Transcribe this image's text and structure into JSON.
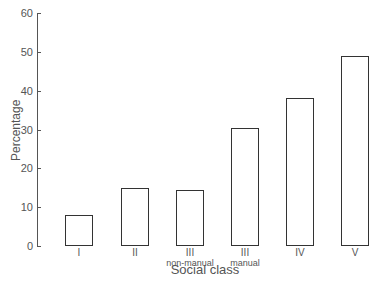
{
  "chart_data": {
    "type": "bar",
    "title": "",
    "xlabel": "Social class",
    "ylabel": "Percentage",
    "ylim": [
      0,
      60
    ],
    "yticks": [
      0,
      10,
      20,
      30,
      40,
      50,
      60
    ],
    "grid": false,
    "legend": null,
    "categories": [
      "I",
      "II",
      "III non-manual",
      "III manual",
      "IV",
      "V"
    ],
    "category_labels": [
      {
        "main": "I",
        "sub": ""
      },
      {
        "main": "II",
        "sub": ""
      },
      {
        "main": "III",
        "sub": "non-manual"
      },
      {
        "main": "III",
        "sub": "manual"
      },
      {
        "main": "IV",
        "sub": ""
      },
      {
        "main": "V",
        "sub": ""
      }
    ],
    "values": [
      8,
      15,
      14.5,
      30.5,
      38,
      49
    ],
    "bar_style": {
      "fill": "#ffffff",
      "stroke": "#333333"
    }
  },
  "axis": {
    "y_title": "Percentage",
    "x_title": "Social class",
    "tick_labels": [
      "0",
      "10",
      "20",
      "30",
      "40",
      "50",
      "60"
    ]
  },
  "labels": {
    "c0_main": "I",
    "c0_sub": "",
    "c1_main": "II",
    "c1_sub": "",
    "c2_main": "III",
    "c2_sub": "non-manual",
    "c3_main": "III",
    "c3_sub": "manual",
    "c4_main": "IV",
    "c4_sub": "",
    "c5_main": "V",
    "c5_sub": ""
  }
}
